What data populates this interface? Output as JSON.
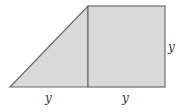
{
  "diagram": {
    "colors": {
      "fill": "#d9d9d9",
      "stroke": "#6b6b6b",
      "background": "#ffffff"
    },
    "shapes": {
      "triangle": {
        "points": "10,87 88,6 88,87"
      },
      "square": {
        "x": 88,
        "y": 6,
        "width": 77,
        "height": 81
      }
    },
    "labels": {
      "triangle_base": "y",
      "square_base": "y",
      "square_side": "y"
    }
  }
}
